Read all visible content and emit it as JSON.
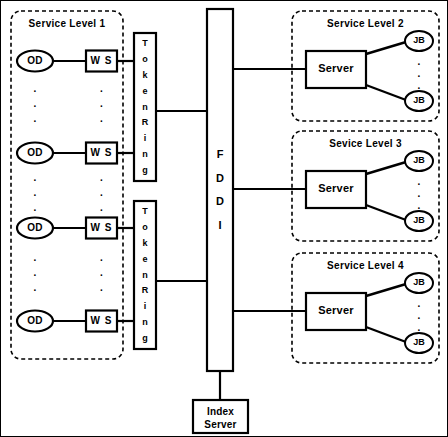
{
  "diagram": {
    "background_color": "#ffffff",
    "stroke_color": "#000000",
    "canvas": {
      "width": 448,
      "height": 437
    }
  },
  "service_level_1": {
    "title": "Service Level 1",
    "box_style": "dashed-rounded",
    "clients": [
      {
        "od_label": "OD",
        "ws_label": "W S"
      },
      {
        "od_label": "OD",
        "ws_label": "W S"
      },
      {
        "od_label": "OD",
        "ws_label": "W S"
      },
      {
        "od_label": "OD",
        "ws_label": "W S"
      }
    ],
    "ellipsis_glyph": "."
  },
  "token_rings": [
    {
      "label": "Token Ring",
      "letters": [
        "T",
        "o",
        "k",
        "e",
        "n",
        "R",
        "i",
        "n",
        "g"
      ]
    },
    {
      "label": "Token Ring",
      "letters": [
        "T",
        "o",
        "k",
        "e",
        "n",
        "R",
        "i",
        "n",
        "g"
      ]
    }
  ],
  "backbone": {
    "label": "FDDI",
    "letters": [
      "F",
      "D",
      "D",
      "I"
    ]
  },
  "index_server": {
    "line1": "Index",
    "line2": "Server"
  },
  "service_levels_right": [
    {
      "title": "Service Level 2",
      "server_label": "Server",
      "jobs": [
        {
          "label": "JB"
        },
        {
          "label": "JB"
        }
      ],
      "ellipsis_glyph": "."
    },
    {
      "title": "Sevice Level 3",
      "server_label": "Server",
      "jobs": [
        {
          "label": "JB"
        },
        {
          "label": "JB"
        }
      ],
      "ellipsis_glyph": "."
    },
    {
      "title": "Service Level 4",
      "server_label": "Server",
      "jobs": [
        {
          "label": "JB"
        },
        {
          "label": "JB"
        }
      ],
      "ellipsis_glyph": "."
    }
  ]
}
